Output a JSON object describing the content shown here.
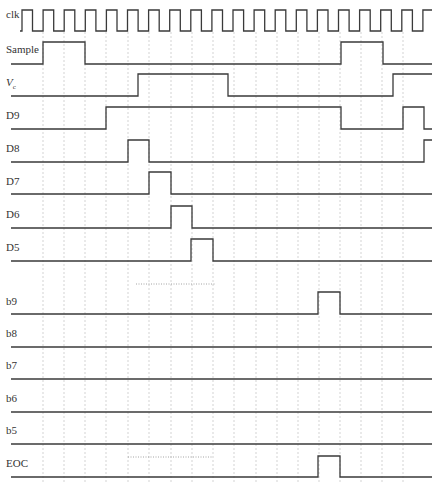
{
  "diagram": {
    "title": "",
    "type": "timing-diagram",
    "colors": {
      "signal": "#3a3a3a",
      "grid": "#c8c8c8",
      "background": "#ffffff"
    },
    "grid_x": [
      43,
      64,
      85,
      106,
      128,
      149,
      171,
      192,
      213,
      234,
      256,
      277,
      298,
      319,
      340,
      361,
      382,
      403
    ],
    "x_start": 11,
    "x_end": 432,
    "clock": {
      "label": "clk",
      "high_y": 10,
      "low_y": 31,
      "x_start": 20,
      "first_rise": 22,
      "period": 21.1,
      "duty": 0.5,
      "cycles": 20
    },
    "signals": [
      {
        "id": "sample",
        "label": "Sample",
        "label_y": 53,
        "low_y": 64,
        "high_y": 42,
        "initial": 0,
        "edges": [
          43,
          85,
          341,
          383
        ]
      },
      {
        "id": "vc",
        "label": "V",
        "label_sub": "c",
        "italic": true,
        "label_y": 86,
        "low_y": 96,
        "high_y": 74,
        "initial": 0,
        "edges": [
          138,
          228,
          393
        ]
      },
      {
        "id": "d9",
        "label": "D9",
        "label_y": 119,
        "low_y": 129,
        "high_y": 107,
        "initial": 0,
        "edges": [
          106,
          341,
          403,
          424
        ]
      },
      {
        "id": "d8",
        "label": "D8",
        "label_y": 152,
        "low_y": 162,
        "high_y": 140,
        "initial": 0,
        "edges": [
          128,
          149,
          424
        ]
      },
      {
        "id": "d7",
        "label": "D7",
        "label_y": 185,
        "low_y": 194,
        "high_y": 172,
        "initial": 0,
        "edges": [
          149,
          171
        ]
      },
      {
        "id": "d6",
        "label": "D6",
        "label_y": 218,
        "low_y": 228,
        "high_y": 206,
        "initial": 0,
        "edges": [
          171,
          192
        ]
      },
      {
        "id": "d5",
        "label": "D5",
        "label_y": 251,
        "low_y": 261,
        "high_y": 239,
        "initial": 0,
        "edges": [
          191,
          213
        ]
      },
      {
        "id": "b9",
        "label": "b9",
        "label_y": 305,
        "low_y": 314,
        "high_y": 292,
        "initial": 0,
        "edges": [
          318,
          340
        ]
      },
      {
        "id": "b8",
        "label": "b8",
        "label_y": 337,
        "low_y": 347,
        "high_y": 325,
        "initial": 0,
        "edges": []
      },
      {
        "id": "b7",
        "label": "b7",
        "label_y": 369,
        "low_y": 379,
        "high_y": 357,
        "initial": 0,
        "edges": []
      },
      {
        "id": "b6",
        "label": "b6",
        "label_y": 402,
        "low_y": 412,
        "high_y": 390,
        "initial": 0,
        "edges": []
      },
      {
        "id": "b5",
        "label": "b5",
        "label_y": 434,
        "low_y": 444,
        "high_y": 422,
        "initial": 0,
        "edges": []
      },
      {
        "id": "eoc",
        "label": "EOC",
        "label_y": 467,
        "low_y": 477,
        "high_y": 456,
        "initial": 0,
        "edges": [
          318,
          340
        ]
      }
    ],
    "ellipses": [
      {
        "x1": 136,
        "x2": 215,
        "y": 284
      },
      {
        "x1": 128,
        "x2": 212,
        "y": 457
      }
    ]
  }
}
